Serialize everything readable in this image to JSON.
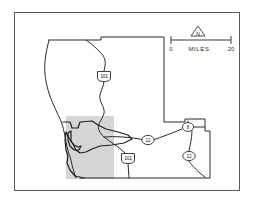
{
  "map": {
    "title": "County highway location map",
    "frame": {
      "x": 14,
      "y": 12,
      "width": 226,
      "height": 179,
      "border_color": "#5a5a5a"
    },
    "study_area": {
      "label": "shaded study area",
      "x": 66,
      "y": 116,
      "width": 48,
      "height": 63,
      "fill_color": "#d5d5d5"
    },
    "boundary": {
      "label": "county boundary",
      "line_color": "#2b2b2b"
    },
    "coastline": {
      "label": "pacific coastline",
      "line_color": "#2b2b2b"
    },
    "bay": {
      "label": "bay and estuary",
      "line_color": "#1f1f1f"
    },
    "routes": [
      {
        "id": "us-101-north",
        "number": "101",
        "type": "us-shield",
        "cx": 104,
        "cy": 76
      },
      {
        "id": "us-101-south",
        "number": "101",
        "type": "us-shield",
        "cx": 128,
        "cy": 158
      },
      {
        "id": "sr-12-central",
        "number": "12",
        "type": "circle",
        "cx": 148,
        "cy": 140
      },
      {
        "id": "sr-8-east",
        "number": "8",
        "type": "circle",
        "cx": 188,
        "cy": 127
      },
      {
        "id": "sr-12-southeast",
        "number": "12",
        "type": "circle",
        "cx": 189,
        "cy": 156
      }
    ],
    "scale_bar": {
      "min_label": "0",
      "max_label": "20",
      "unit_label": "MILES",
      "x_start": 171,
      "x_end": 231,
      "y": 40
    },
    "north_arrow": {
      "label": "N",
      "cx": 198,
      "cy": 32
    }
  }
}
